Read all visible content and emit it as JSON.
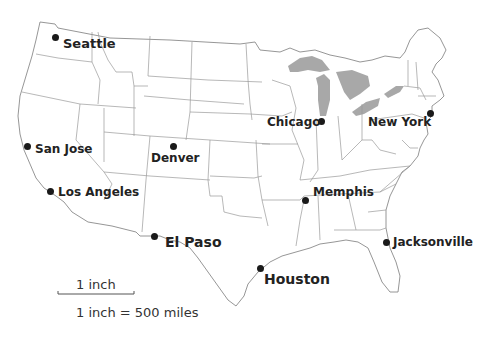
{
  "map": {
    "title": "United States map with cities",
    "lake_color": "#a8a8a8",
    "border_color": "#8a8a8a",
    "dot_color": "#1a1a1a"
  },
  "cities": [
    {
      "name": "Seattle",
      "dot": [
        55,
        37
      ],
      "label_pos": [
        63,
        37
      ],
      "font_size": 13
    },
    {
      "name": "San Jose",
      "dot": [
        27,
        146
      ],
      "label_pos": [
        35,
        143
      ],
      "font_size": 12
    },
    {
      "name": "Los Angeles",
      "dot": [
        50,
        191
      ],
      "label_pos": [
        58,
        186
      ],
      "font_size": 12
    },
    {
      "name": "Denver",
      "dot": [
        173,
        146
      ],
      "label_pos": [
        151,
        152
      ],
      "font_size": 12
    },
    {
      "name": "El Paso",
      "dot": [
        154,
        236
      ],
      "label_pos": [
        165,
        235
      ],
      "font_size": 14
    },
    {
      "name": "Chicago",
      "dot": [
        321,
        121
      ],
      "label_pos": [
        267,
        116
      ],
      "font_size": 12
    },
    {
      "name": "New York",
      "dot": [
        430,
        113
      ],
      "label_pos": [
        368,
        116
      ],
      "font_size": 12
    },
    {
      "name": "Memphis",
      "dot": [
        305,
        200
      ],
      "label_pos": [
        313,
        186
      ],
      "font_size": 12
    },
    {
      "name": "Jacksonville",
      "dot": [
        386,
        242
      ],
      "label_pos": [
        393,
        236
      ],
      "font_size": 12
    },
    {
      "name": "Houston",
      "dot": [
        260,
        268
      ],
      "label_pos": [
        264,
        272
      ],
      "font_size": 14
    }
  ],
  "scale": {
    "bar_label": "1 inch",
    "ratio_text": "1 inch = 500 miles"
  }
}
